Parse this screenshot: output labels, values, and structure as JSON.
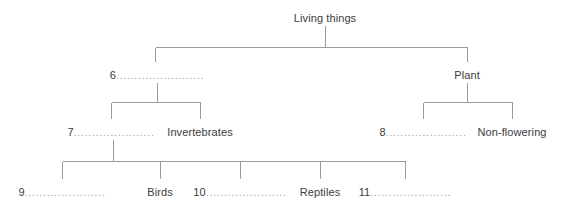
{
  "diagram": {
    "line_color": "#9b9b9b",
    "text_color": "#3c3c3c",
    "leader_color": "#9a9a9a",
    "background": "#ffffff",
    "levels": [
      {
        "level": 0,
        "nodes": [
          {
            "id": "living-things",
            "label": "Living things",
            "blank": false,
            "x": 325,
            "y": 12
          }
        ]
      },
      {
        "level": 1,
        "nodes": [
          {
            "id": "blank-6",
            "label": "6",
            "leader": "........................",
            "blank": true,
            "x": 157,
            "y": 69
          },
          {
            "id": "plant",
            "label": "Plant",
            "blank": false,
            "x": 467,
            "y": 69
          }
        ]
      },
      {
        "level": 2,
        "nodes": [
          {
            "id": "blank-7",
            "label": "7",
            "leader": "......................",
            "blank": true,
            "x": 111,
            "y": 126
          },
          {
            "id": "invertebrates",
            "label": "Invertebrates",
            "blank": false,
            "x": 200,
            "y": 126
          },
          {
            "id": "blank-8",
            "label": "8",
            "leader": "......................",
            "blank": true,
            "x": 423,
            "y": 126
          },
          {
            "id": "non-flowering",
            "label": "Non-flowering",
            "blank": false,
            "x": 512,
            "y": 126
          }
        ]
      },
      {
        "level": 3,
        "nodes": [
          {
            "id": "blank-9",
            "label": "9",
            "leader": "......................",
            "blank": true,
            "x": 62,
            "y": 186
          },
          {
            "id": "birds",
            "label": "Birds",
            "blank": false,
            "x": 160,
            "y": 186
          },
          {
            "id": "blank-10",
            "label": "10",
            "leader": "......................",
            "blank": true,
            "x": 240,
            "y": 186
          },
          {
            "id": "reptiles",
            "label": "Reptiles",
            "blank": false,
            "x": 320,
            "y": 186
          },
          {
            "id": "blank-11",
            "label": "11",
            "leader": "......................",
            "blank": true,
            "x": 405,
            "y": 186
          }
        ]
      }
    ]
  },
  "nodes": {
    "living_things": "Living things",
    "blank6_num": "6",
    "blank6_leader": "........................",
    "plant": "Plant",
    "blank7_num": "7",
    "blank7_leader": "......................",
    "invertebrates": "Invertebrates",
    "blank8_num": "8",
    "blank8_leader": "......................",
    "non_flowering": "Non-flowering",
    "blank9_num": "9",
    "blank9_leader": "......................",
    "birds": "Birds",
    "blank10_num": "10",
    "blank10_leader": "......................",
    "reptiles": "Reptiles",
    "blank11_num": "11",
    "blank11_leader": "......................"
  }
}
